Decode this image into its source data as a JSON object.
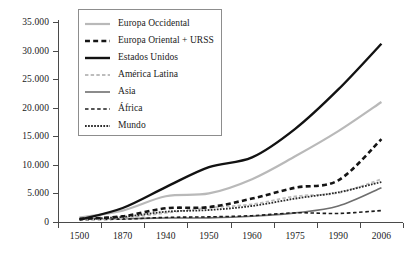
{
  "chart_data": {
    "type": "line",
    "title": "",
    "subtitle": "",
    "xlabel": "",
    "ylabel": "",
    "grid": false,
    "legend_position": "top-left-inside",
    "categories": [
      "1500",
      "1870",
      "1940",
      "1950",
      "1960",
      "1975",
      "1990",
      "2006"
    ],
    "x": [
      1500,
      1870,
      1940,
      1950,
      1960,
      1975,
      1990,
      2006
    ],
    "ylim": [
      0,
      35000
    ],
    "yticks": [
      0,
      5000,
      10000,
      15000,
      20000,
      25000,
      30000,
      35000
    ],
    "ytick_labels": [
      "0",
      "5.000",
      "10.000",
      "15.000",
      "20.000",
      "25.000",
      "30.000",
      "35.000"
    ],
    "series": [
      {
        "name": "Europa Occidental",
        "color": "#b9b9b9",
        "style": "solid",
        "width": 2.2,
        "values": [
          800,
          2000,
          4500,
          5000,
          7500,
          11500,
          15900,
          21000
        ]
      },
      {
        "name": "Europa Oriental + URSS",
        "color": "#151515",
        "style": "dash",
        "width": 2.6,
        "values": [
          550,
          1000,
          2400,
          2600,
          4100,
          6000,
          7300,
          14500
        ]
      },
      {
        "name": "Estados Unidos",
        "color": "#121212",
        "style": "solid",
        "width": 2.4,
        "values": [
          400,
          2450,
          6100,
          9600,
          11300,
          16300,
          23200,
          31200
        ]
      },
      {
        "name": "América Latina",
        "color": "#bdbdbd",
        "style": "dash",
        "width": 1.8,
        "values": [
          420,
          700,
          1600,
          2500,
          3100,
          4500,
          5100,
          7500
        ]
      },
      {
        "name": "Asia",
        "color": "#6e6e6e",
        "style": "solid",
        "width": 1.6,
        "values": [
          570,
          580,
          700,
          720,
          1000,
          1600,
          2800,
          6000
        ]
      },
      {
        "name": "África",
        "color": "#1c1c1c",
        "style": "dash-thin",
        "width": 1.6,
        "values": [
          410,
          500,
          800,
          900,
          1100,
          1600,
          1500,
          2000
        ]
      },
      {
        "name": "Mundo",
        "color": "#2a2a2a",
        "style": "dot",
        "width": 1.8,
        "values": [
          560,
          880,
          1800,
          2100,
          2800,
          4100,
          5200,
          7000
        ]
      }
    ]
  },
  "legend": {
    "items": [
      {
        "label": "Europa Occidental"
      },
      {
        "label": "Europa Oriental + URSS"
      },
      {
        "label": "Estados Unidos"
      },
      {
        "label": "América Latina"
      },
      {
        "label": "Asia"
      },
      {
        "label": "África"
      },
      {
        "label": "Mundo"
      }
    ]
  },
  "caption": ""
}
